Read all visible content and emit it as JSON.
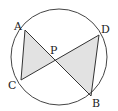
{
  "diagram": {
    "type": "geometry",
    "circle": {
      "cx": 59,
      "cy": 57,
      "r": 48
    },
    "points": {
      "A": {
        "label": "A",
        "x": 25,
        "y": 30,
        "lx": 14,
        "ly": 30
      },
      "D": {
        "label": "D",
        "x": 99,
        "y": 35,
        "lx": 101,
        "ly": 32
      },
      "C": {
        "label": "C",
        "x": 21,
        "y": 80,
        "lx": 9,
        "ly": 88
      },
      "B": {
        "label": "B",
        "x": 91,
        "y": 96,
        "lx": 92,
        "ly": 107
      },
      "P": {
        "label": "P",
        "x": 55,
        "y": 60,
        "lx": 50,
        "ly": 54
      }
    },
    "segments": [
      "AB",
      "CD",
      "AC",
      "DB"
    ],
    "shaded_triangles": [
      "APC",
      "DPB"
    ],
    "colors": {
      "stroke": "#333333",
      "fill": "#e2e2e2",
      "background": "#ffffff"
    }
  }
}
